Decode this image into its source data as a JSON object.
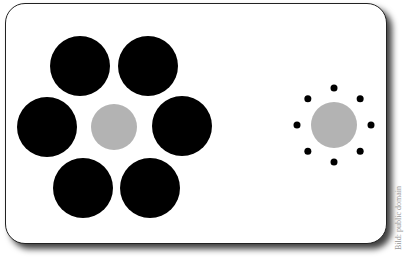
{
  "illustration": {
    "title": "Ebbinghaus illusion",
    "colors": {
      "large_ring": "#000000",
      "center": "#b3b3b3",
      "small_ring": "#000000",
      "card": "#ffffff"
    },
    "left_group": {
      "center": {
        "cx": 114,
        "cy": 127,
        "r": 23
      },
      "surrounding": [
        {
          "cx": 80,
          "cy": 66,
          "r": 30
        },
        {
          "cx": 148,
          "cy": 66,
          "r": 30
        },
        {
          "cx": 47,
          "cy": 127,
          "r": 30
        },
        {
          "cx": 182,
          "cy": 126,
          "r": 30
        },
        {
          "cx": 83,
          "cy": 188,
          "r": 30
        },
        {
          "cx": 150,
          "cy": 188,
          "r": 30
        }
      ]
    },
    "right_group": {
      "center": {
        "cx": 334,
        "cy": 125,
        "r": 23
      },
      "surrounding_count": 8,
      "ring_radius": 37,
      "dot_radius": 3.5
    }
  },
  "credit": "Bild: public domain"
}
